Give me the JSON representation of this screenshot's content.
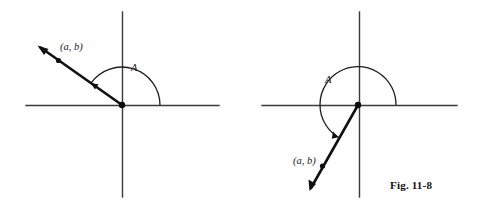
{
  "figure": {
    "caption": "Fig. 11-8",
    "background_color": "#fefefe",
    "ink_color": "#111111",
    "axis_color": "#3a3a3a"
  },
  "panels": [
    {
      "id": "left-panel",
      "name": "obtuse-angle-diagram",
      "point_label": "(a, b)",
      "angle_label": "A",
      "quadrant_of_point": "second",
      "angle_description": "obtuse angle measured counterclockwise from positive x-axis to ray through (a, b)",
      "origin": {
        "x": 122,
        "y": 105
      },
      "x_axis": {
        "x1": 26,
        "y1": 105,
        "x2": 219,
        "y2": 105
      },
      "y_axis": {
        "x1": 122,
        "y1": 12,
        "x2": 122,
        "y2": 197
      },
      "ray": {
        "x1": 122,
        "y1": 105,
        "x2": 38,
        "y2": 46
      },
      "point_dot": {
        "x": 58,
        "y": 60
      },
      "point_label_pos": {
        "x": 60,
        "y": 50
      },
      "angle_label_pos": {
        "x": 131,
        "y": 71
      },
      "arc": {
        "radius": 38,
        "start_angle_deg": 0,
        "end_angle_deg": 145
      }
    },
    {
      "id": "right-panel",
      "name": "reflex-angle-diagram",
      "point_label": "(a, b)",
      "angle_label": "A",
      "quadrant_of_point": "third",
      "angle_description": "reflex angle measured counterclockwise from positive x-axis to ray through (a, b)",
      "origin": {
        "x": 358,
        "y": 105
      },
      "x_axis": {
        "x1": 262,
        "y1": 105,
        "x2": 457,
        "y2": 105
      },
      "y_axis": {
        "x1": 359,
        "y1": 12,
        "x2": 359,
        "y2": 197
      },
      "ray": {
        "x1": 358,
        "y1": 105,
        "x2": 310,
        "y2": 190
      },
      "point_dot": {
        "x": 322,
        "y": 166
      },
      "point_label_pos": {
        "x": 293,
        "y": 164
      },
      "angle_label_pos": {
        "x": 325,
        "y": 83
      },
      "arc": {
        "radius": 38,
        "start_angle_deg": 0,
        "end_angle_deg": 240
      }
    }
  ],
  "caption_pos": {
    "x": 390,
    "y": 189
  }
}
